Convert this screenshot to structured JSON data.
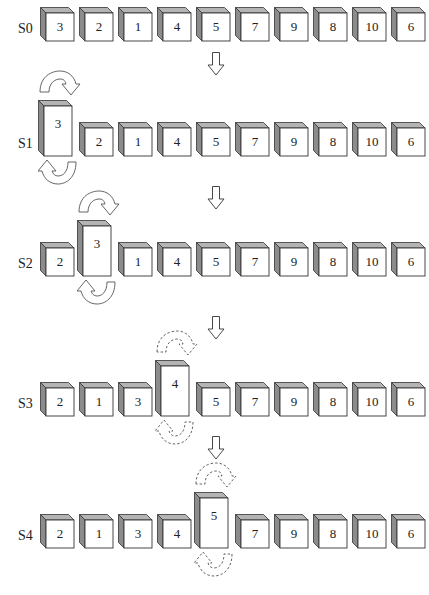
{
  "diagram": {
    "title": "",
    "colors": {
      "face": "#ffffff",
      "side": "#8c8c8c",
      "top": "#b4b4b4",
      "stroke": "#333333"
    },
    "stages": [
      {
        "label": "S0",
        "values": [
          "3",
          "2",
          "1",
          "4",
          "5",
          "7",
          "9",
          "8",
          "10",
          "6"
        ],
        "raised_index": -1,
        "swap_arrows": "none"
      },
      {
        "label": "S1",
        "values": [
          "3",
          "2",
          "1",
          "4",
          "5",
          "7",
          "9",
          "8",
          "10",
          "6"
        ],
        "raised_index": 0,
        "swap_arrows": "solid"
      },
      {
        "label": "S2",
        "values": [
          "2",
          "3",
          "1",
          "4",
          "5",
          "7",
          "9",
          "8",
          "10",
          "6"
        ],
        "raised_index": 1,
        "swap_arrows": "solid"
      },
      {
        "label": "S3",
        "values": [
          "2",
          "1",
          "3",
          "4",
          "5",
          "7",
          "9",
          "8",
          "10",
          "6"
        ],
        "raised_index": 3,
        "swap_arrows": "dashed"
      },
      {
        "label": "S4",
        "values": [
          "2",
          "1",
          "3",
          "4",
          "5",
          "7",
          "9",
          "8",
          "10",
          "6"
        ],
        "raised_index": 4,
        "swap_arrows": "dashed"
      }
    ],
    "transition_arrows": [
      "down-arrow",
      "down-arrow",
      "down-arrow",
      "down-arrow"
    ]
  }
}
